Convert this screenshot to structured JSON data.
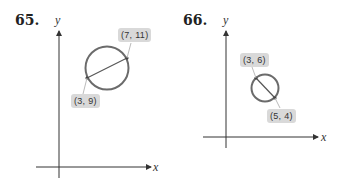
{
  "problems": [
    {
      "number": "65.",
      "x_label": "x",
      "y_label": "y",
      "endpoints": [
        {
          "label": "(7, 11)"
        },
        {
          "label": "(3, 9)"
        }
      ]
    },
    {
      "number": "66.",
      "x_label": "x",
      "y_label": "y",
      "endpoints": [
        {
          "label": "(3, 6)"
        },
        {
          "label": "(5, 4)"
        }
      ]
    }
  ],
  "colors": {
    "circle": "#6b6b6b",
    "axis": "#333333",
    "label_bg": "#d9d9d9"
  }
}
